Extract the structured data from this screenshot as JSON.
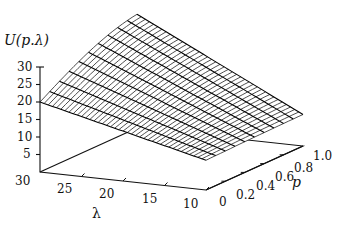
{
  "chart_data": {
    "type": "surface3d",
    "title": "",
    "zlabel": "U(p.λ)",
    "xlabel": "λ",
    "ylabel": "p",
    "x_ticks": [
      "30",
      "25",
      "20",
      "15",
      "10"
    ],
    "y_ticks": [
      "0",
      "0.2",
      "0.4",
      "0.6",
      "0.8",
      "1.0"
    ],
    "z_ticks": [
      "30",
      "25",
      "20",
      "15",
      "10",
      "5"
    ],
    "xlim": [
      10,
      30
    ],
    "ylim": [
      0,
      1.0
    ],
    "zlim": [
      0,
      30
    ],
    "grid_lambda_lines": 40,
    "grid_p_lines": 11,
    "corner_values": {
      "lambda30_p0": 20,
      "lambda30_p1": 32.5,
      "lambda10_p0": 8.5,
      "lambda10_p1": 9
    }
  }
}
